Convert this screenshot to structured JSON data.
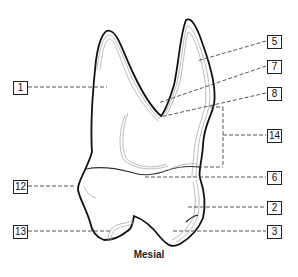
{
  "title": "Mesial",
  "labels": [
    {
      "id": "1",
      "target": "palatal root region"
    },
    {
      "id": "5",
      "target": "buccal root"
    },
    {
      "id": "7",
      "target": "furcation"
    },
    {
      "id": "8",
      "target": "root trunk"
    },
    {
      "id": "14",
      "target": "root concavity"
    },
    {
      "id": "6",
      "target": "cementoenamel junction"
    },
    {
      "id": "12",
      "target": "height of contour (palatal)"
    },
    {
      "id": "2",
      "target": "height of contour (buccal)"
    },
    {
      "id": "3",
      "target": "buccal cusp"
    },
    {
      "id": "13",
      "target": "palatal cusp"
    }
  ],
  "colors": {
    "outline": "#111111",
    "inner_line": "#9a9a9a",
    "leader": "#444444"
  }
}
